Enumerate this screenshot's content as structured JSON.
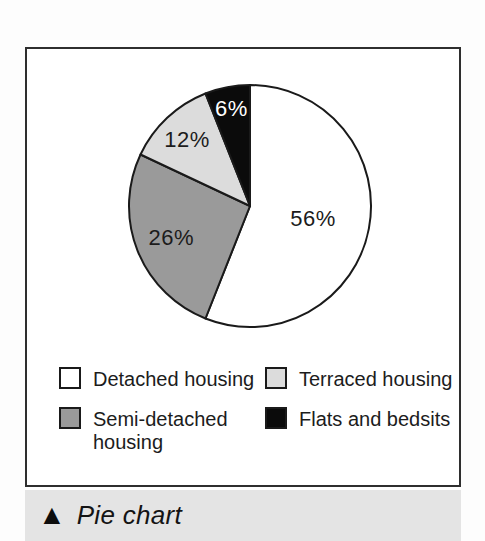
{
  "chart_data": {
    "type": "pie",
    "title": "",
    "start_angle_deg": 0,
    "direction": "clockwise",
    "stroke_color": "#1a1a1a",
    "total_pct": 100,
    "slices": [
      {
        "category": "Detached housing",
        "value_pct": 56,
        "data_label": "56%",
        "color": "#ffffff",
        "label_color": "#1c1c1c",
        "label_radius_frac": 0.53
      },
      {
        "category": "Semi-detached housing",
        "value_pct": 26,
        "data_label": "26%",
        "color": "#9a9a9a",
        "label_color": "#1c1c1c",
        "label_radius_frac": 0.7
      },
      {
        "category": "Terraced housing",
        "value_pct": 12,
        "data_label": "12%",
        "color": "#dcdcdc",
        "label_color": "#1c1c1c",
        "label_radius_frac": 0.76
      },
      {
        "category": "Flats and bedsits",
        "value_pct": 6,
        "data_label": "6%",
        "color": "#0b0b0b",
        "label_color": "#ffffff",
        "label_radius_frac": 0.82
      }
    ],
    "legend_position": "below-chart two-column grid"
  },
  "legend": {
    "items": [
      {
        "label": "Detached housing",
        "color": "#ffffff"
      },
      {
        "label": "Terraced housing",
        "color": "#dcdcdc"
      },
      {
        "label": "Semi-detached housing",
        "color": "#9a9a9a"
      },
      {
        "label": "Flats and bedsits",
        "color": "#0b0b0b"
      }
    ]
  },
  "caption": {
    "marker": "▲",
    "text": "Pie chart",
    "band_color": "#e4e4e4"
  },
  "figure_box": {
    "border_color": "#2e2e2e",
    "background": "#ffffff"
  }
}
